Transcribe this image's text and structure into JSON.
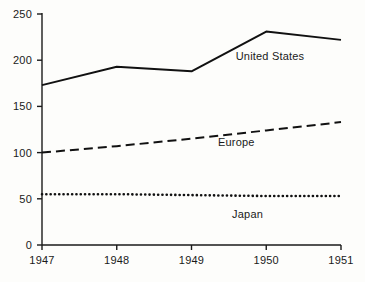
{
  "chart_data": {
    "type": "line",
    "title": "",
    "subtitle": "",
    "xlabel": "",
    "ylabel": "",
    "x": [
      1947,
      1948,
      1949,
      1950,
      1951
    ],
    "categories": [
      "1947",
      "1948",
      "1949",
      "1950",
      "1951"
    ],
    "xlim": [
      1947,
      1951
    ],
    "ylim": [
      0,
      250
    ],
    "y_ticks": [
      0,
      50,
      100,
      150,
      200,
      250
    ],
    "y_tick_labels": [
      "0",
      "50",
      "100",
      "150",
      "200",
      "250"
    ],
    "x_ticks": [
      1947,
      1948,
      1949,
      1950,
      1951
    ],
    "x_tick_labels": [
      "1947",
      "1948",
      "1949",
      "1950",
      "1951"
    ],
    "grid": false,
    "legend_position": "inline-annotation",
    "series": [
      {
        "name": "United States",
        "label": "United States",
        "style": "solid",
        "color": "#111111",
        "width": 2.0,
        "values": [
          173,
          193,
          188,
          231,
          222
        ],
        "label_x": 1950.05,
        "label_y": 205
      },
      {
        "name": "Europe",
        "label": "Europe",
        "style": "dashed",
        "color": "#111111",
        "width": 2.0,
        "values": [
          100,
          107,
          115,
          124,
          133
        ],
        "label_x": 1949.6,
        "label_y": 112
      },
      {
        "name": "Japan",
        "label": "Japan",
        "style": "dotted",
        "color": "#111111",
        "width": 2.6,
        "values": [
          55,
          55,
          54,
          53,
          53
        ],
        "label_x": 1949.75,
        "label_y": 34
      }
    ]
  },
  "figure": {
    "background_color": "#fdfdfb",
    "axis_color": "#1a1a1a",
    "text_color": "#1a1a1a"
  }
}
